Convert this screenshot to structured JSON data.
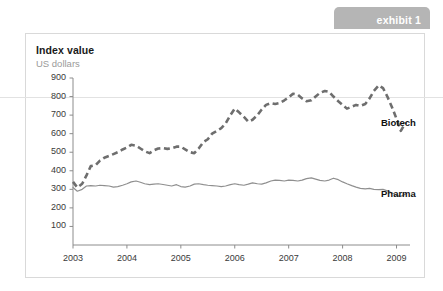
{
  "exhibit": {
    "label": "exhibit 1"
  },
  "card": {
    "title": "Index value",
    "subtitle": "US dollars"
  },
  "colors": {
    "tab_background": "#b5b5b5",
    "tab_text": "#ffffff",
    "card_border": "#d9d9d9",
    "axis": "#8c8c8c",
    "biotech_line": "#6e6e6e",
    "pharma_line": "#8f8f8f",
    "rule_800": "#e2e2e2",
    "title_text": "#1a1a1a",
    "subtitle_text": "#9a9a9a"
  },
  "chart_data": {
    "type": "line",
    "title": "Index value",
    "subtitle": "US dollars",
    "xlabel": "",
    "ylabel": "Index value (US dollars)",
    "ylim": [
      0,
      900
    ],
    "xlim": [
      2003,
      2009.25
    ],
    "yticks": [
      100,
      200,
      300,
      400,
      500,
      600,
      700,
      800,
      900
    ],
    "xticks": [
      2003,
      2004,
      2005,
      2006,
      2007,
      2008,
      2009
    ],
    "grid": false,
    "reference_line": {
      "y": 800,
      "color": "#e2e2e2",
      "spans_full_width": true
    },
    "legend": {
      "position": "right-inline",
      "entries": [
        "Biotech",
        "Pharma"
      ]
    },
    "series": [
      {
        "name": "Biotech",
        "style": "dashed",
        "color": "#6e6e6e",
        "x": [
          2003.0,
          2003.08,
          2003.17,
          2003.25,
          2003.33,
          2003.42,
          2003.5,
          2003.58,
          2003.67,
          2003.75,
          2003.83,
          2003.92,
          2004.0,
          2004.08,
          2004.17,
          2004.25,
          2004.33,
          2004.42,
          2004.5,
          2004.58,
          2004.67,
          2004.75,
          2004.83,
          2004.92,
          2005.0,
          2005.08,
          2005.17,
          2005.25,
          2005.33,
          2005.42,
          2005.5,
          2005.58,
          2005.67,
          2005.75,
          2005.83,
          2005.92,
          2006.0,
          2006.08,
          2006.17,
          2006.25,
          2006.33,
          2006.42,
          2006.5,
          2006.58,
          2006.67,
          2006.75,
          2006.83,
          2006.92,
          2007.0,
          2007.08,
          2007.17,
          2007.25,
          2007.33,
          2007.42,
          2007.5,
          2007.58,
          2007.67,
          2007.75,
          2007.83,
          2007.92,
          2008.0,
          2008.08,
          2008.17,
          2008.25,
          2008.33,
          2008.42,
          2008.5,
          2008.58,
          2008.67,
          2008.75,
          2008.83,
          2008.92,
          2009.0,
          2009.08,
          2009.17
        ],
        "values": [
          340,
          310,
          330,
          375,
          425,
          430,
          455,
          470,
          480,
          490,
          500,
          515,
          525,
          540,
          535,
          520,
          505,
          495,
          510,
          520,
          522,
          518,
          522,
          530,
          530,
          515,
          500,
          495,
          520,
          555,
          570,
          600,
          615,
          630,
          655,
          700,
          735,
          715,
          690,
          665,
          675,
          700,
          730,
          755,
          765,
          760,
          765,
          780,
          795,
          815,
          810,
          790,
          775,
          780,
          800,
          820,
          830,
          825,
          800,
          775,
          755,
          735,
          745,
          755,
          750,
          760,
          790,
          830,
          860,
          845,
          800,
          740,
          680,
          615,
          660
        ]
      },
      {
        "name": "Pharma",
        "style": "solid",
        "color": "#8f8f8f",
        "x": [
          2003.0,
          2003.08,
          2003.17,
          2003.25,
          2003.33,
          2003.42,
          2003.5,
          2003.58,
          2003.67,
          2003.75,
          2003.83,
          2003.92,
          2004.0,
          2004.08,
          2004.17,
          2004.25,
          2004.33,
          2004.42,
          2004.5,
          2004.58,
          2004.67,
          2004.75,
          2004.83,
          2004.92,
          2005.0,
          2005.08,
          2005.17,
          2005.25,
          2005.33,
          2005.42,
          2005.5,
          2005.58,
          2005.67,
          2005.75,
          2005.83,
          2005.92,
          2006.0,
          2006.08,
          2006.17,
          2006.25,
          2006.33,
          2006.42,
          2006.5,
          2006.58,
          2006.67,
          2006.75,
          2006.83,
          2006.92,
          2007.0,
          2007.08,
          2007.17,
          2007.25,
          2007.33,
          2007.42,
          2007.5,
          2007.58,
          2007.67,
          2007.75,
          2007.83,
          2007.92,
          2008.0,
          2008.08,
          2008.17,
          2008.25,
          2008.33,
          2008.42,
          2008.5,
          2008.58,
          2008.67,
          2008.75,
          2008.83,
          2008.92,
          2009.0,
          2009.08,
          2009.17
        ],
        "values": [
          310,
          290,
          300,
          318,
          320,
          318,
          322,
          320,
          318,
          312,
          315,
          322,
          330,
          340,
          345,
          338,
          330,
          325,
          328,
          330,
          326,
          322,
          318,
          325,
          315,
          312,
          318,
          328,
          330,
          325,
          322,
          320,
          318,
          315,
          318,
          325,
          330,
          325,
          322,
          328,
          335,
          330,
          328,
          335,
          345,
          350,
          348,
          345,
          350,
          348,
          345,
          350,
          358,
          362,
          355,
          348,
          345,
          350,
          360,
          352,
          340,
          330,
          320,
          312,
          305,
          302,
          305,
          300,
          298,
          300,
          292,
          280,
          268,
          262,
          275
        ]
      }
    ]
  },
  "axes": {
    "ytick_labels": [
      "900",
      "800",
      "700",
      "600",
      "500",
      "400",
      "300",
      "200",
      "100"
    ],
    "xtick_labels": [
      "2003",
      "2004",
      "2005",
      "2006",
      "2007",
      "2008",
      "2009"
    ]
  }
}
